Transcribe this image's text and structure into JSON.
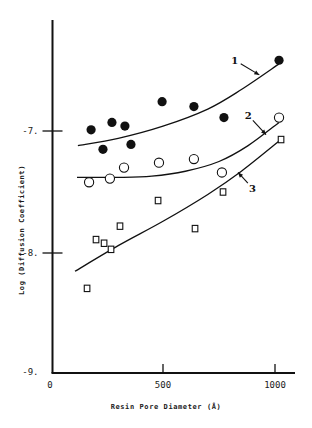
{
  "chart_data": {
    "type": "scatter",
    "title": "",
    "xlabel": "Resin Pore Diameter (Å)",
    "ylabel": "Log (Diffusion Coefficient)",
    "xlim": [
      0,
      1100
    ],
    "ylim": [
      -9,
      -6.1
    ],
    "x_ticks": [
      0,
      500,
      1000
    ],
    "x_tick_labels": [
      "0",
      "500",
      "1000"
    ],
    "y_ticks": [
      -7,
      -8,
      -9
    ],
    "y_tick_labels": [
      "-7.",
      "-8.",
      "-9."
    ],
    "grid": false,
    "legend": "none",
    "series": [
      {
        "name": "1",
        "marker": "filled-circle",
        "points": [
          [
            179,
            -6.99
          ],
          [
            232,
            -7.15
          ],
          [
            272,
            -6.93
          ],
          [
            330,
            -6.96
          ],
          [
            357,
            -7.11
          ],
          [
            496,
            -6.76
          ],
          [
            638,
            -6.8
          ],
          [
            772,
            -6.89
          ],
          [
            1018,
            -6.42
          ]
        ],
        "fit_curve": [
          [
            120,
            -7.12
          ],
          [
            300,
            -7.06
          ],
          [
            500,
            -6.96
          ],
          [
            700,
            -6.82
          ],
          [
            850,
            -6.66
          ],
          [
            1018,
            -6.45
          ]
        ]
      },
      {
        "name": "2",
        "marker": "open-circle",
        "points": [
          [
            170,
            -7.42
          ],
          [
            263,
            -7.39
          ],
          [
            326,
            -7.3
          ],
          [
            482,
            -7.26
          ],
          [
            638,
            -7.23
          ],
          [
            763,
            -7.34
          ],
          [
            1018,
            -6.89
          ]
        ],
        "fit_curve": [
          [
            116,
            -7.38
          ],
          [
            300,
            -7.38
          ],
          [
            450,
            -7.37
          ],
          [
            600,
            -7.33
          ],
          [
            750,
            -7.25
          ],
          [
            880,
            -7.12
          ],
          [
            1018,
            -6.93
          ]
        ]
      },
      {
        "name": "3",
        "marker": "open-square",
        "points": [
          [
            161,
            -8.29
          ],
          [
            201,
            -7.89
          ],
          [
            237,
            -7.92
          ],
          [
            268,
            -7.97
          ],
          [
            308,
            -7.78
          ],
          [
            478,
            -7.57
          ],
          [
            643,
            -7.8
          ],
          [
            768,
            -7.5
          ],
          [
            1027,
            -7.07
          ]
        ],
        "fit_curve": [
          [
            107,
            -8.15
          ],
          [
            300,
            -7.94
          ],
          [
            500,
            -7.74
          ],
          [
            700,
            -7.52
          ],
          [
            850,
            -7.33
          ],
          [
            1027,
            -7.07
          ]
        ]
      }
    ],
    "annotations": [
      {
        "text": "1",
        "target_series": "1",
        "arrow_to": [
          930,
          -6.54
        ],
        "label_at": [
          820,
          -6.42
        ]
      },
      {
        "text": "2",
        "target_series": "2",
        "arrow_to": [
          960,
          -7.03
        ],
        "label_at": [
          880,
          -6.87
        ]
      },
      {
        "text": "3",
        "target_series": "3",
        "arrow_to": [
          835,
          -7.34
        ],
        "label_at": [
          900,
          -7.47
        ]
      }
    ]
  }
}
